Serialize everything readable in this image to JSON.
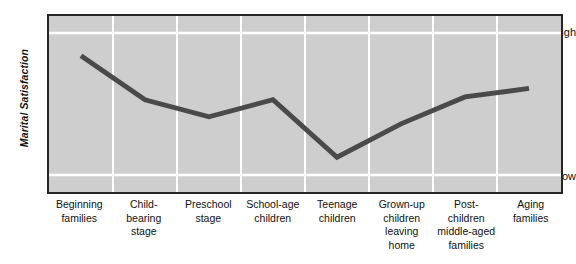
{
  "chart_data": {
    "type": "line",
    "title": "",
    "xlabel": "",
    "ylabel": "Marital Satisfaction",
    "categories": [
      "Beginning families",
      "Child-bearing stage",
      "Preschool stage",
      "School-age children",
      "Teenage children",
      "Grown-up children leaving home",
      "Post-children middle-aged families",
      "Aging families"
    ],
    "category_lines": [
      [
        "Beginning",
        "families"
      ],
      [
        "Child-",
        "bearing",
        "stage"
      ],
      [
        "Preschool",
        "stage"
      ],
      [
        "School-age",
        "children"
      ],
      [
        "Teenage",
        "children"
      ],
      [
        "Grown-up",
        "children",
        "leaving",
        "home"
      ],
      [
        "Post-",
        "children",
        "middle-aged",
        "families"
      ],
      [
        "Aging",
        "families"
      ]
    ],
    "values": [
      0.84,
      0.53,
      0.41,
      0.53,
      0.125,
      0.36,
      0.55,
      0.61
    ],
    "ytick_labels": [
      "High",
      "Low"
    ],
    "ytick_values": [
      1.0,
      0.0
    ],
    "ylim": [
      -0.12,
      1.12
    ],
    "grid": "both",
    "grid_color": "#ffffff",
    "legend": "none",
    "plot_background": "#cecece",
    "line_color": "#4a4a4a",
    "line_width": 5,
    "frame_color": "#262626"
  },
  "axes": {
    "y_title": "Marital Satisfaction",
    "y_high_label": "High",
    "y_low_label": "Low"
  }
}
